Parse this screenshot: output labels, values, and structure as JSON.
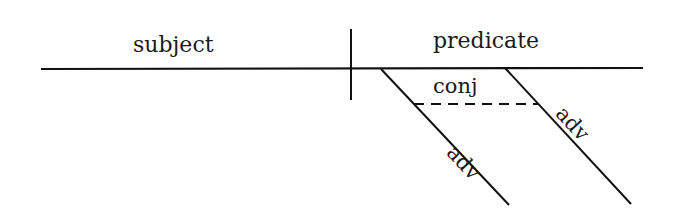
{
  "diagram": {
    "type": "sentence-diagram",
    "labels": {
      "subject": "subject",
      "predicate": "predicate",
      "conjunction": "conj",
      "adverb_left": "adv",
      "adverb_right": "adv"
    },
    "colors": {
      "line": "#111111",
      "text": "#1a1a1a",
      "background": "#ffffff"
    }
  }
}
